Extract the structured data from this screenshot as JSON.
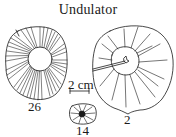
{
  "figure": {
    "title": "Undulator",
    "scale_bar": {
      "label": "2 cm"
    },
    "specimens": [
      {
        "id": "left",
        "label": "26"
      },
      {
        "id": "right",
        "label": "2"
      },
      {
        "id": "small",
        "label": "14"
      }
    ]
  },
  "colors": {
    "ink": "#1a1a1a",
    "background": "#ffffff"
  }
}
